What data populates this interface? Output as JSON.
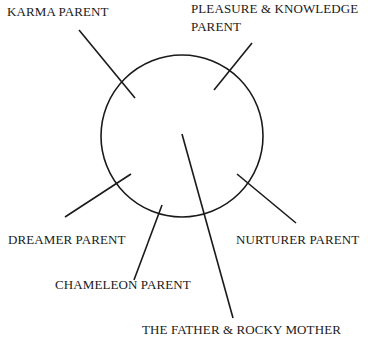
{
  "diagram": {
    "type": "hub-and-spoke",
    "center": {
      "shape": "circle",
      "label": ""
    },
    "labels": {
      "karma": "KARMA PARENT",
      "pleasure_line1": "PLEASURE & KNOWLEDGE",
      "pleasure_line2": "PARENT",
      "dreamer": "DREAMER PARENT",
      "nurturer": "NURTURER PARENT",
      "chameleon": "CHAMELEON PARENT",
      "bottom_clipped": "THE FATHER & ROCKY MOTHER"
    },
    "colors": {
      "stroke": "#1a1a1a",
      "text": "#1a1a1a",
      "background": "#ffffff"
    }
  }
}
